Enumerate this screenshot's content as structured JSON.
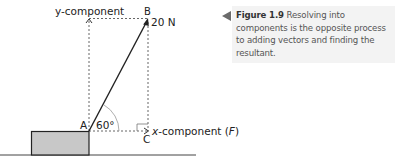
{
  "figure": {
    "label": "Figure 1.9",
    "caption": " Resolving into components is the opposite process to adding vectors and finding the resultant."
  },
  "diagram": {
    "labels": {
      "y_component": "y-component",
      "point_b": "B",
      "force": "20 N",
      "point_a": "A",
      "angle": "60°",
      "point_c": "C",
      "x_component_prefix": "x",
      "x_component_mid": "-component (",
      "x_component_var": "F",
      "x_component_suffix": ")"
    },
    "vector": {
      "magnitude_N": 20,
      "angle_deg": 60
    },
    "colors": {
      "line": "#222222",
      "dashed": "#555555",
      "block_fill": "#c8c8c8",
      "caption_bg": "#f3f3f3",
      "caption_arrow": "#6b6b6b"
    }
  }
}
